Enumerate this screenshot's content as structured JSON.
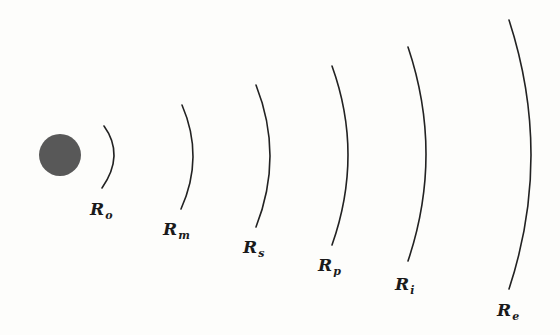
{
  "colors": {
    "background": "#fdfdfb",
    "source": "#585858",
    "arc": "#222222",
    "label": "#1a1a1a"
  },
  "source": {
    "name": "central-source",
    "cx": 60,
    "cy": 155,
    "r": 21
  },
  "arcs": [
    {
      "id": "o",
      "label_main": "R",
      "label_sub": "o",
      "top": [
        104,
        126
      ],
      "mid": [
        114,
        156
      ],
      "bottom": [
        102,
        188
      ],
      "label_pos": [
        90,
        201
      ]
    },
    {
      "id": "m",
      "label_main": "R",
      "label_sub": "m",
      "top": [
        182,
        105
      ],
      "mid": [
        193,
        157
      ],
      "bottom": [
        181,
        209
      ],
      "label_pos": [
        163,
        221
      ]
    },
    {
      "id": "s",
      "label_main": "R",
      "label_sub": "s",
      "top": [
        256,
        85
      ],
      "mid": [
        270,
        156
      ],
      "bottom": [
        256,
        227
      ],
      "label_pos": [
        243,
        239
      ]
    },
    {
      "id": "p",
      "label_main": "R",
      "label_sub": "p",
      "top": [
        332,
        66
      ],
      "mid": [
        348,
        155
      ],
      "bottom": [
        332,
        245
      ],
      "label_pos": [
        318,
        257
      ]
    },
    {
      "id": "i",
      "label_main": "R",
      "label_sub": "i",
      "top": [
        408,
        47
      ],
      "mid": [
        426,
        154
      ],
      "bottom": [
        408,
        261
      ],
      "label_pos": [
        395,
        276
      ]
    },
    {
      "id": "e",
      "label_main": "R",
      "label_sub": "e",
      "top": [
        509,
        20
      ],
      "mid": [
        531,
        155
      ],
      "bottom": [
        509,
        289
      ],
      "label_pos": [
        497,
        302
      ]
    }
  ]
}
